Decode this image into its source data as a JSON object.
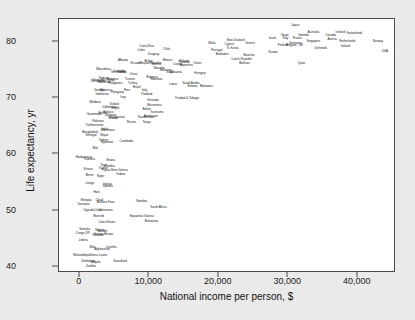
{
  "chart_data": {
    "type": "scatter",
    "title": "",
    "xlabel": "National income per person, $",
    "ylabel": "Life expectancy, yr",
    "xlim": [
      -3000,
      45500
    ],
    "ylim": [
      39.0,
      84.0
    ],
    "xticks": [
      0,
      10000,
      20000,
      30000,
      40000
    ],
    "xticklabels": [
      "0",
      "10,000",
      "20,000",
      "30,000",
      "40,000"
    ],
    "yticks": [
      40,
      50,
      60,
      70,
      80
    ],
    "yticklabels": [
      "40",
      "50",
      "60",
      "70",
      "80"
    ],
    "grid": false,
    "legend": false,
    "marker_style": "text-label",
    "note": "Each data point is rendered as the country name text rather than a plotted marker.",
    "points": [
      {
        "label": "Japan",
        "x": 31000,
        "y": 82.7
      },
      {
        "label": "Australia",
        "x": 33600,
        "y": 81.6
      },
      {
        "label": "Iceland",
        "x": 37500,
        "y": 81.5
      },
      {
        "label": "Switzerland",
        "x": 39500,
        "y": 81.4
      },
      {
        "label": "Sweden",
        "x": 32200,
        "y": 81.0
      },
      {
        "label": "Spain",
        "x": 29500,
        "y": 81.0
      },
      {
        "label": "Canada",
        "x": 36100,
        "y": 80.9
      },
      {
        "label": "Israel",
        "x": 27700,
        "y": 80.5
      },
      {
        "label": "Italy",
        "x": 29600,
        "y": 80.4
      },
      {
        "label": "France",
        "x": 31300,
        "y": 80.4
      },
      {
        "label": "Austria",
        "x": 36300,
        "y": 80.2
      },
      {
        "label": "Netherlands",
        "x": 38500,
        "y": 80.0
      },
      {
        "label": "Singapore",
        "x": 33600,
        "y": 79.9
      },
      {
        "label": "Norway",
        "x": 42900,
        "y": 80.0
      },
      {
        "label": "Malta",
        "x": 19000,
        "y": 79.6
      },
      {
        "label": "New Zealand",
        "x": 22400,
        "y": 80.1
      },
      {
        "label": "Cyprus",
        "x": 21500,
        "y": 79.4
      },
      {
        "label": "Greece",
        "x": 24500,
        "y": 79.5
      },
      {
        "label": "Germany",
        "x": 31000,
        "y": 79.6
      },
      {
        "label": "Ireland",
        "x": 38200,
        "y": 79.0
      },
      {
        "label": "USA",
        "x": 43900,
        "y": 78.2
      },
      {
        "label": "UK",
        "x": 31800,
        "y": 79.2
      },
      {
        "label": "Denmark",
        "x": 34700,
        "y": 78.7
      },
      {
        "label": "Belgium",
        "x": 30400,
        "y": 79.2
      },
      {
        "label": "Finland",
        "x": 29200,
        "y": 79.2
      },
      {
        "label": "Kuwait",
        "x": 27800,
        "y": 78.0
      },
      {
        "label": "Qatar",
        "x": 31900,
        "y": 76.0
      },
      {
        "label": "Costa Rica",
        "x": 9600,
        "y": 79.0
      },
      {
        "label": "Cuba",
        "x": 8800,
        "y": 78.4
      },
      {
        "label": "Chile",
        "x": 12500,
        "y": 78.5
      },
      {
        "label": "Portugal",
        "x": 19700,
        "y": 78.4
      },
      {
        "label": "Barbados",
        "x": 20500,
        "y": 77.7
      },
      {
        "label": "S. Korea",
        "x": 22000,
        "y": 78.6
      },
      {
        "label": "Slovenia",
        "x": 24300,
        "y": 77.4
      },
      {
        "label": "Czech Republic",
        "x": 23300,
        "y": 76.8
      },
      {
        "label": "Bahrain",
        "x": 23700,
        "y": 76.0
      },
      {
        "label": "Uruguay",
        "x": 10600,
        "y": 77.6
      },
      {
        "label": "Mexico",
        "x": 12600,
        "y": 76.5
      },
      {
        "label": "Panama",
        "x": 15000,
        "y": 76.2
      },
      {
        "label": "Oman",
        "x": 16900,
        "y": 76.0
      },
      {
        "label": "Poland",
        "x": 15000,
        "y": 76.3
      },
      {
        "label": "Albania",
        "x": 6200,
        "y": 76.6
      },
      {
        "label": "Croatia",
        "x": 14100,
        "y": 75.9
      },
      {
        "label": "Argentina",
        "x": 15300,
        "y": 75.7
      },
      {
        "label": "Bosnia",
        "x": 11000,
        "y": 75.9
      },
      {
        "label": "Papua/Hrvatska",
        "x": 10200,
        "y": 76.1
      },
      {
        "label": "Belize",
        "x": 9900,
        "y": 76.3
      },
      {
        "label": "Ecuador",
        "x": 8100,
        "y": 76.1
      },
      {
        "label": "Slovakia",
        "x": 11400,
        "y": 75.2
      },
      {
        "label": "Macedonia",
        "x": 3400,
        "y": 75.0
      },
      {
        "label": "Libya",
        "x": 13000,
        "y": 74.5
      },
      {
        "label": "Malaysia",
        "x": 12400,
        "y": 74.8
      },
      {
        "label": "Hungary",
        "x": 17300,
        "y": 74.2
      },
      {
        "label": "Serbia",
        "x": 6100,
        "y": 74.5
      },
      {
        "label": "Venezuela",
        "x": 5500,
        "y": 74.5
      },
      {
        "label": "Colombia",
        "x": 5700,
        "y": 74.6
      },
      {
        "label": "China",
        "x": 7700,
        "y": 74.0
      },
      {
        "label": "Lithuania",
        "x": 13800,
        "y": 74.5
      },
      {
        "label": "Tunisia",
        "x": 7200,
        "y": 73.2
      },
      {
        "label": "Bulgaria",
        "x": 10400,
        "y": 73.5
      },
      {
        "label": "Romania",
        "x": 11000,
        "y": 73.2
      },
      {
        "label": "Armenia",
        "x": 4700,
        "y": 73.2
      },
      {
        "label": "Sri Lanka",
        "x": 4100,
        "y": 73.0
      },
      {
        "label": "Nicaragua",
        "x": 2600,
        "y": 72.8
      },
      {
        "label": "Honduras",
        "x": 3500,
        "y": 72.7
      },
      {
        "label": "Vietnam",
        "x": 2600,
        "y": 73.0
      },
      {
        "label": "Samoa",
        "x": 3400,
        "y": 73.3
      },
      {
        "label": "Philippines",
        "x": 5100,
        "y": 72.5
      },
      {
        "label": "Turkey",
        "x": 7600,
        "y": 72.5
      },
      {
        "label": "Latvia",
        "x": 13400,
        "y": 72.3
      },
      {
        "label": "Saudi Arabia",
        "x": 16000,
        "y": 72.5
      },
      {
        "label": "Estonia",
        "x": 16200,
        "y": 72.0
      },
      {
        "label": "Bahamas",
        "x": 18200,
        "y": 72.0
      },
      {
        "label": "Morocco",
        "x": 3700,
        "y": 71.3
      },
      {
        "label": "Georgia",
        "x": 2800,
        "y": 71.2
      },
      {
        "label": "Brazil",
        "x": 8200,
        "y": 71.8
      },
      {
        "label": "Italy2",
        "x": 9300,
        "y": 71.2
      },
      {
        "label": "Peru",
        "x": 6800,
        "y": 71.2
      },
      {
        "label": "Thailand",
        "x": 9600,
        "y": 70.6
      },
      {
        "label": "Indonesia",
        "x": 3200,
        "y": 70.5
      },
      {
        "label": "Paraguay",
        "x": 5400,
        "y": 70.9
      },
      {
        "label": "Iraq",
        "x": 6200,
        "y": 70.0
      },
      {
        "label": "Trinidad & Tobago",
        "x": 15400,
        "y": 69.8
      },
      {
        "label": "Grenada",
        "x": 10500,
        "y": 69.4
      },
      {
        "label": "Moldova",
        "x": 2200,
        "y": 69.2
      },
      {
        "label": "Micronesia",
        "x": 10700,
        "y": 68.6
      },
      {
        "label": "Uzbekistan",
        "x": 4300,
        "y": 68.2
      },
      {
        "label": "Kiribati",
        "x": 5000,
        "y": 68.7
      },
      {
        "label": "Nepal",
        "x": 5100,
        "y": 68.0
      },
      {
        "label": "Belarus",
        "x": 4100,
        "y": 67.4
      },
      {
        "label": "Bolivia",
        "x": 3300,
        "y": 67.2
      },
      {
        "label": "Tajikistan",
        "x": 4400,
        "y": 66.9
      },
      {
        "label": "Belize2",
        "x": 9600,
        "y": 67.9
      },
      {
        "label": "Suriname",
        "x": 11100,
        "y": 67.4
      },
      {
        "label": "Azerbaijan",
        "x": 10200,
        "y": 66.7
      },
      {
        "label": "Kyrgyzstan",
        "x": 5400,
        "y": 66.4
      },
      {
        "label": "Bhutan",
        "x": 4800,
        "y": 66.3
      },
      {
        "label": "Kazakhstan",
        "x": 9500,
        "y": 66.4
      },
      {
        "label": "Guatemala",
        "x": 2000,
        "y": 67.0
      },
      {
        "label": "Tonga",
        "x": 9600,
        "y": 65.5
      },
      {
        "label": "Pakistan",
        "x": 2600,
        "y": 65.8
      },
      {
        "label": "Russia",
        "x": 7400,
        "y": 65.6
      },
      {
        "label": "Turkmenistan",
        "x": 2100,
        "y": 65.0
      },
      {
        "label": "India",
        "x": 3600,
        "y": 64.4
      },
      {
        "label": "Mauritania",
        "x": 4000,
        "y": 64.2
      },
      {
        "label": "Bangladesh",
        "x": 1500,
        "y": 63.8
      },
      {
        "label": "Senegal",
        "x": 1600,
        "y": 63.2
      },
      {
        "label": "Nepal2",
        "x": 3500,
        "y": 63.3
      },
      {
        "label": "Yemen",
        "x": 3400,
        "y": 62.4
      },
      {
        "label": "Myanmar",
        "x": 3900,
        "y": 62.0
      },
      {
        "label": "Cambodia",
        "x": 6700,
        "y": 62.2
      },
      {
        "label": "Mali",
        "x": 2200,
        "y": 60.9
      },
      {
        "label": "Madagascar",
        "x": 600,
        "y": 59.4
      },
      {
        "label": "Gambia",
        "x": 1400,
        "y": 59.0
      },
      {
        "label": "Ghana",
        "x": 4400,
        "y": 58.8
      },
      {
        "label": "Togo",
        "x": 3400,
        "y": 58.0
      },
      {
        "label": "Zambia",
        "x": 4300,
        "y": 57.8
      },
      {
        "label": "Eritrea",
        "x": 1200,
        "y": 57.3
      },
      {
        "label": "Sudan",
        "x": 3400,
        "y": 57.5
      },
      {
        "label": "Papua New Guinea",
        "x": 5000,
        "y": 57.0
      },
      {
        "label": "Gabon",
        "x": 5900,
        "y": 56.4
      },
      {
        "label": "Benin",
        "x": 1400,
        "y": 56.2
      },
      {
        "label": "Niger",
        "x": 3000,
        "y": 56.0
      },
      {
        "label": "Congo",
        "x": 1400,
        "y": 54.8
      },
      {
        "label": "Kenya",
        "x": 4000,
        "y": 54.6
      },
      {
        "label": "Djibouti",
        "x": 4000,
        "y": 54.2
      },
      {
        "label": "Haiti",
        "x": 2400,
        "y": 53.2
      },
      {
        "label": "Ethiopia",
        "x": 900,
        "y": 51.8
      },
      {
        "label": "Chad",
        "x": 2800,
        "y": 51.7
      },
      {
        "label": "Burkina Faso",
        "x": 3700,
        "y": 51.4
      },
      {
        "label": "Namibia",
        "x": 8900,
        "y": 51.6
      },
      {
        "label": "Tanzania",
        "x": 500,
        "y": 51.0
      },
      {
        "label": "South Africa",
        "x": 11300,
        "y": 50.5
      },
      {
        "label": "Uganda",
        "x": 1300,
        "y": 50.0
      },
      {
        "label": "Cameroon",
        "x": 3700,
        "y": 50.0
      },
      {
        "label": "Chad2",
        "x": 2600,
        "y": 49.9
      },
      {
        "label": "Equatorial Guinea",
        "x": 8900,
        "y": 49.0
      },
      {
        "label": "Burundi",
        "x": 2700,
        "y": 49.0
      },
      {
        "label": "Botswana",
        "x": 10300,
        "y": 48.0
      },
      {
        "label": "Cote d'Ivoire",
        "x": 3900,
        "y": 47.8
      },
      {
        "label": "Somalia",
        "x": 700,
        "y": 46.7
      },
      {
        "label": "Nigeria",
        "x": 2900,
        "y": 46.5
      },
      {
        "label": "Malawi",
        "x": 3300,
        "y": 46.3
      },
      {
        "label": "Congo DR",
        "x": 400,
        "y": 45.9
      },
      {
        "label": "Guinea-Bissau",
        "x": 3400,
        "y": 45.8
      },
      {
        "label": "Rwanda",
        "x": 2600,
        "y": 45.5
      },
      {
        "label": "Liberia",
        "x": 500,
        "y": 44.7
      },
      {
        "label": "Mali2",
        "x": 1800,
        "y": 43.5
      },
      {
        "label": "Afghanistan",
        "x": 3200,
        "y": 43.0
      },
      {
        "label": "Lesotho",
        "x": 4500,
        "y": 43.4
      },
      {
        "label": "Mozambique",
        "x": 300,
        "y": 42.1
      },
      {
        "label": "Sierra Leone",
        "x": 2700,
        "y": 42.0
      },
      {
        "label": "Zimbabwe",
        "x": 1200,
        "y": 41.0
      },
      {
        "label": "Angola",
        "x": 2300,
        "y": 40.8
      },
      {
        "label": "Swaziland",
        "x": 5800,
        "y": 41.0
      },
      {
        "label": "Zambia2",
        "x": 1600,
        "y": 40.0
      }
    ]
  }
}
